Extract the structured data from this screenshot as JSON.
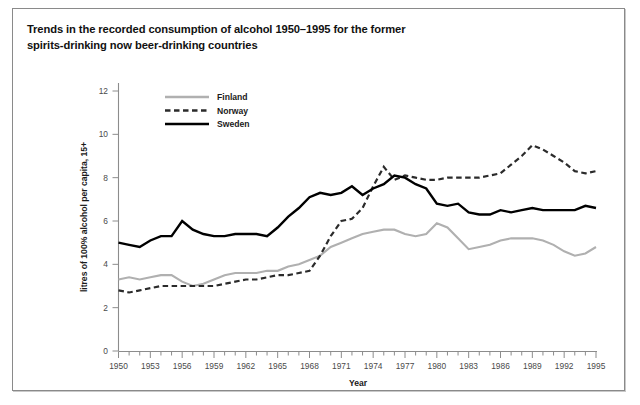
{
  "title": {
    "line1": "Trends in the recorded consumption of alcohol 1950–1995 for the former",
    "line2": "spirits-drinking now beer-drinking countries"
  },
  "axes": {
    "xlabel": "Year",
    "ylabel": "litres of 100% alcohol per capita, 15+",
    "x_ticklabels": [
      "1950",
      "1953",
      "1956",
      "1959",
      "1962",
      "1965",
      "1968",
      "1971",
      "1974",
      "1977",
      "1980",
      "1983",
      "1986",
      "1989",
      "1992",
      "1995"
    ],
    "y_ticklabels": [
      "0",
      "2",
      "4",
      "6",
      "8",
      "10",
      "12"
    ]
  },
  "legend": {
    "position": "top-left-inside",
    "items": [
      {
        "label": "Finland",
        "color": "#b0b0b0",
        "style": "solid"
      },
      {
        "label": "Norway",
        "color": "#2b2b2b",
        "style": "dashed"
      },
      {
        "label": "Sweden",
        "color": "#000000",
        "style": "solid"
      }
    ]
  },
  "chart_data": {
    "type": "line",
    "title": "Trends in the recorded consumption of alcohol 1950–1995 for the former spirits-drinking now beer-drinking countries",
    "xlabel": "Year",
    "ylabel": "litres of 100% alcohol per capita, 15+",
    "xlim": [
      1950,
      1995
    ],
    "ylim": [
      0,
      12
    ],
    "ytick_step": 2,
    "xtick_step_labeled": 3,
    "xtick_step_minor": 1,
    "grid": false,
    "x": [
      1950,
      1951,
      1952,
      1953,
      1954,
      1955,
      1956,
      1957,
      1958,
      1959,
      1960,
      1961,
      1962,
      1963,
      1964,
      1965,
      1966,
      1967,
      1968,
      1969,
      1970,
      1971,
      1972,
      1973,
      1974,
      1975,
      1976,
      1977,
      1978,
      1979,
      1980,
      1981,
      1982,
      1983,
      1984,
      1985,
      1986,
      1987,
      1988,
      1989,
      1990,
      1991,
      1992,
      1993,
      1994,
      1995
    ],
    "series": [
      {
        "name": "Finland",
        "color": "#b0b0b0",
        "style": "solid",
        "values": [
          3.3,
          3.4,
          3.3,
          3.4,
          3.5,
          3.5,
          3.2,
          3.0,
          3.1,
          3.3,
          3.5,
          3.6,
          3.6,
          3.6,
          3.7,
          3.7,
          3.9,
          4.0,
          4.2,
          4.4,
          4.8,
          5.0,
          5.2,
          5.4,
          5.5,
          5.6,
          5.6,
          5.4,
          5.3,
          5.4,
          5.9,
          5.7,
          5.2,
          4.7,
          4.8,
          4.9,
          5.1,
          5.2,
          5.2,
          5.2,
          5.1,
          4.9,
          4.6,
          4.4,
          4.5,
          4.8
        ]
      },
      {
        "name": "Norway",
        "color": "#2b2b2b",
        "style": "dashed",
        "values": [
          2.8,
          2.7,
          2.8,
          2.9,
          3.0,
          3.0,
          3.0,
          3.0,
          3.0,
          3.0,
          3.1,
          3.2,
          3.3,
          3.3,
          3.4,
          3.5,
          3.5,
          3.6,
          3.7,
          4.4,
          5.3,
          6.0,
          6.1,
          6.6,
          7.6,
          8.5,
          7.9,
          8.1,
          8.0,
          7.9,
          7.9,
          8.0,
          8.0,
          8.0,
          8.0,
          8.1,
          8.2,
          8.6,
          9.0,
          9.5,
          9.3,
          9.0,
          8.7,
          8.3,
          8.2,
          8.3
        ]
      },
      {
        "name": "Sweden",
        "color": "#000000",
        "style": "solid",
        "values": [
          5.0,
          4.9,
          4.8,
          5.1,
          5.3,
          5.3,
          6.0,
          5.6,
          5.4,
          5.3,
          5.3,
          5.4,
          5.4,
          5.4,
          5.3,
          5.7,
          6.2,
          6.6,
          7.1,
          7.3,
          7.2,
          7.3,
          7.6,
          7.2,
          7.5,
          7.7,
          8.1,
          8.0,
          7.7,
          7.5,
          6.8,
          6.7,
          6.8,
          6.4,
          6.3,
          6.3,
          6.5,
          6.4,
          6.5,
          6.6,
          6.5,
          6.5,
          6.5,
          6.5,
          6.7,
          6.6
        ]
      }
    ]
  }
}
